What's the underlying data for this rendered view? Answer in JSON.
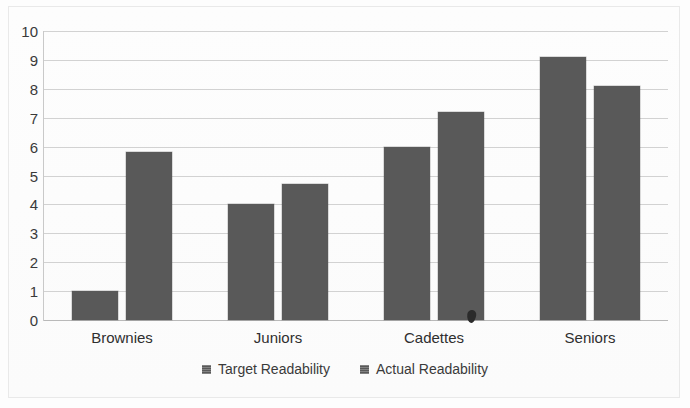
{
  "chart_data": {
    "type": "bar",
    "title": "",
    "xlabel": "",
    "ylabel": "",
    "ylim": [
      0,
      10
    ],
    "ytick_labels": [
      "10",
      "9",
      "8",
      "7",
      "6",
      "5",
      "4",
      "3",
      "2",
      "1",
      "0"
    ],
    "ytick_values": [
      10,
      9,
      8,
      7,
      6,
      5,
      4,
      3,
      2,
      1,
      0
    ],
    "categories": [
      "Brownies",
      "Juniors",
      "Cadettes",
      "Seniors"
    ],
    "series": [
      {
        "name": "Target Readability",
        "color": "#595959",
        "values": [
          1.0,
          4.0,
          6.0,
          9.1
        ]
      },
      {
        "name": "Actual Readability",
        "color": "#595959",
        "values": [
          5.8,
          4.7,
          7.2,
          8.1
        ]
      }
    ],
    "grid": true,
    "grid_axis": "y",
    "legend_position": "bottom",
    "orientation": "vertical",
    "grouping": "grouped"
  },
  "legend": {
    "items": [
      {
        "label": "Target Readability",
        "swatch_icon": "legend-square-icon"
      },
      {
        "label": "Actual Readability",
        "swatch_icon": "legend-square-icon"
      }
    ]
  }
}
